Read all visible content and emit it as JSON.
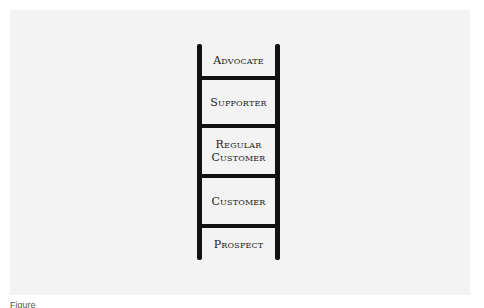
{
  "diagram": {
    "type": "ladder",
    "steps_top_to_bottom": [
      {
        "label": "Advocate"
      },
      {
        "label": "Supporter"
      },
      {
        "label": "Regular Customer"
      },
      {
        "label": "Customer"
      },
      {
        "label": "Prospect"
      }
    ],
    "colors": {
      "background": "#f3f3f3",
      "ladder": "#111111",
      "text": "#222222"
    }
  },
  "caption": {
    "text": "Figure"
  }
}
